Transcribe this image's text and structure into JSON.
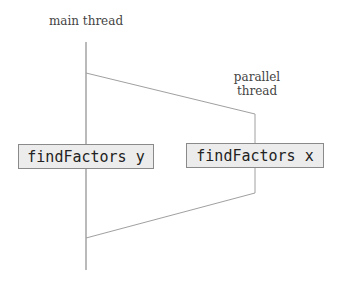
{
  "diagram": {
    "labels": {
      "main_thread": "main thread",
      "parallel_thread_line1": "parallel",
      "parallel_thread_line2": "thread"
    },
    "boxes": {
      "main_call": "findFactors y",
      "parallel_call": "findFactors x"
    },
    "colors": {
      "line": "#8c8c8c",
      "box_fill": "#ececec",
      "box_border": "#8a8a8a",
      "text": "#444444"
    }
  }
}
